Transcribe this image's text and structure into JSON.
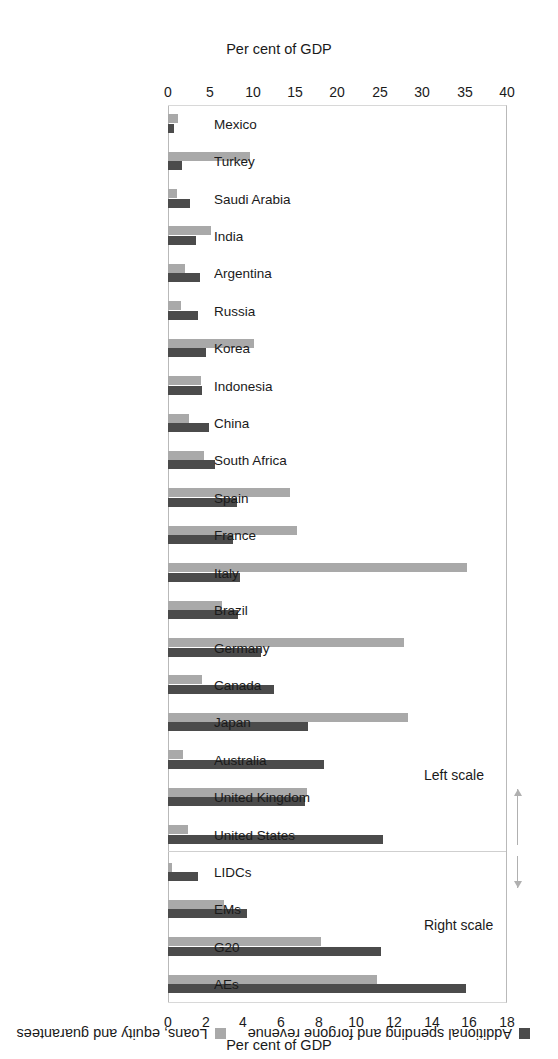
{
  "chart_data": {
    "type": "bar",
    "orientation": "horizontal",
    "title": "",
    "legend": [
      {
        "label": "Additional spending and forgone revenue",
        "color": "#4b4b4b",
        "key": "spending"
      },
      {
        "label": "Loans, equity and guarantees",
        "color": "#a9a9a9",
        "key": "loans"
      }
    ],
    "legend_position": "top-left",
    "grid": false,
    "axes": {
      "left": {
        "label": "Per cent of GDP",
        "ticks": [
          0,
          5,
          10,
          15,
          20,
          25,
          30,
          35,
          40
        ],
        "min": 0,
        "max": 40,
        "applies_to": "Left scale"
      },
      "right": {
        "label": "Per cent of GDP",
        "ticks": [
          0,
          2,
          4,
          6,
          8,
          10,
          12,
          14,
          16,
          18
        ],
        "min": 0,
        "max": 18,
        "applies_to": "Right scale"
      }
    },
    "annotations": [
      {
        "text": "Left scale",
        "arrow": "down"
      },
      {
        "text": "Right scale",
        "arrow": "up"
      }
    ],
    "groups": [
      {
        "name": "countries",
        "scale": "left",
        "categories": [
          "Mexico",
          "Turkey",
          "Saudi Arabia",
          "India",
          "Argentina",
          "Russia",
          "Korea",
          "Indonesia",
          "China",
          "South Africa",
          "Spain",
          "France",
          "Italy",
          "Brazil",
          "Germany",
          "Canada",
          "Japan",
          "Australia",
          "United Kingdom",
          "United States"
        ],
        "series": [
          {
            "name": "Additional spending and forgone revenue",
            "values": [
              0.7,
              1.6,
              2.6,
              3.3,
              3.8,
              3.5,
              4.5,
              4.0,
              4.8,
              5.5,
              8.1,
              7.7,
              8.5,
              8.3,
              11.0,
              12.5,
              16.5,
              18.4,
              16.2,
              25.4
            ]
          },
          {
            "name": "Loans, equity and guarantees",
            "values": [
              1.2,
              9.7,
              1.1,
              5.1,
              2.0,
              1.5,
              10.2,
              3.9,
              2.5,
              4.2,
              14.4,
              15.2,
              35.3,
              6.4,
              27.8,
              4.0,
              28.3,
              1.8,
              16.4,
              2.4
            ]
          }
        ]
      },
      {
        "name": "aggregates",
        "scale": "right",
        "categories": [
          "LIDCs",
          "EMs",
          "G20",
          "AEs"
        ],
        "series": [
          {
            "name": "Additional spending and forgone revenue",
            "values": [
              1.6,
              4.2,
              11.3,
              15.8
            ]
          },
          {
            "name": "Loans, equity and guarantees",
            "values": [
              0.2,
              3.0,
              8.1,
              11.1
            ]
          }
        ]
      }
    ]
  },
  "labels": {
    "per_cent_of_gdp": "Per cent of GDP",
    "left_scale": "Left scale",
    "right_scale": "Right scale"
  }
}
